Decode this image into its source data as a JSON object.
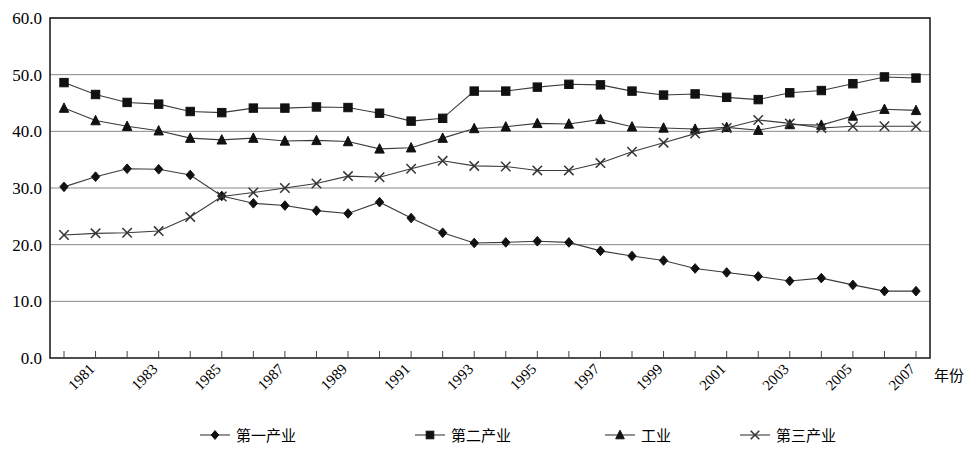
{
  "chart_data": {
    "type": "line",
    "title": "",
    "xlabel": "年份",
    "ylabel": "",
    "ylim": [
      0.0,
      60.0
    ],
    "yticks": [
      "0.0",
      "10.0",
      "20.0",
      "30.0",
      "40.0",
      "50.0",
      "60.0"
    ],
    "ytick_values": [
      0,
      10,
      20,
      30,
      40,
      50,
      60
    ],
    "grid": true,
    "legend_position": "bottom",
    "x": [
      1980,
      1981,
      1982,
      1983,
      1984,
      1985,
      1986,
      1987,
      1988,
      1989,
      1990,
      1991,
      1992,
      1993,
      1994,
      1995,
      1996,
      1997,
      1998,
      1999,
      2000,
      2001,
      2002,
      2003,
      2004,
      2005,
      2006,
      2007
    ],
    "xtick_labels": [
      "",
      "1981",
      "",
      "1983",
      "",
      "1985",
      "",
      "1987",
      "",
      "1989",
      "",
      "1991",
      "",
      "1993",
      "",
      "1995",
      "",
      "1997",
      "",
      "1999",
      "",
      "2001",
      "",
      "2003",
      "",
      "2005",
      "",
      "2007"
    ],
    "series": [
      {
        "name": "第一产业",
        "marker": "diamond",
        "values": [
          30.2,
          32.0,
          33.4,
          33.3,
          32.3,
          28.6,
          27.3,
          26.9,
          26.0,
          25.5,
          27.5,
          24.7,
          22.1,
          20.3,
          20.4,
          20.6,
          20.4,
          18.9,
          18.0,
          17.2,
          15.8,
          15.1,
          14.4,
          13.6,
          14.1,
          12.9,
          11.8,
          11.8
        ]
      },
      {
        "name": "第二产业",
        "marker": "square",
        "values": [
          48.6,
          46.5,
          45.1,
          44.8,
          43.5,
          43.3,
          44.1,
          44.1,
          44.3,
          44.2,
          43.2,
          41.8,
          42.3,
          47.1,
          47.1,
          47.8,
          48.3,
          48.2,
          47.1,
          46.4,
          46.6,
          46.0,
          45.6,
          46.8,
          47.2,
          48.4,
          49.6,
          49.4
        ]
      },
      {
        "name": "工业",
        "marker": "triangle",
        "values": [
          44.1,
          41.9,
          40.9,
          40.1,
          38.8,
          38.5,
          38.8,
          38.3,
          38.4,
          38.2,
          36.9,
          37.1,
          38.8,
          40.5,
          40.8,
          41.4,
          41.3,
          42.1,
          40.8,
          40.6,
          40.4,
          40.7,
          40.2,
          41.2,
          41.1,
          42.7,
          43.9,
          43.7
        ]
      },
      {
        "name": "第三产业",
        "marker": "cross",
        "values": [
          21.7,
          22.0,
          22.1,
          22.4,
          24.9,
          28.5,
          29.2,
          30.0,
          30.8,
          32.1,
          31.9,
          33.4,
          34.8,
          33.9,
          33.8,
          33.1,
          33.1,
          34.4,
          36.4,
          38.0,
          39.6,
          40.6,
          42.0,
          41.4,
          40.6,
          40.9,
          40.9,
          40.9
        ]
      }
    ]
  },
  "axis": {
    "x_title": "年份"
  },
  "legend": {
    "items": [
      {
        "label": "第一产业",
        "marker": "diamond"
      },
      {
        "label": "第二产业",
        "marker": "square"
      },
      {
        "label": "工业",
        "marker": "triangle"
      },
      {
        "label": "第三产业",
        "marker": "cross"
      }
    ]
  }
}
